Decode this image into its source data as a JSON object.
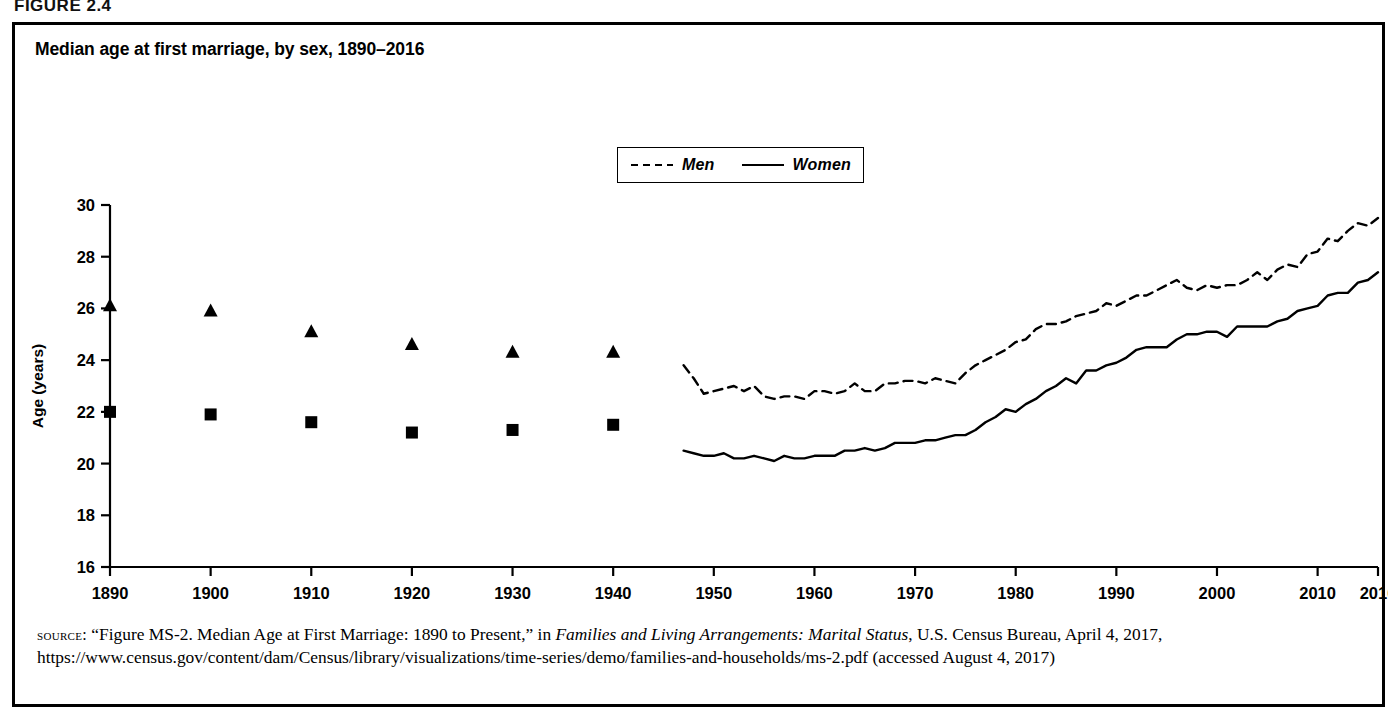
{
  "figure": {
    "label": "FIGURE 2.4",
    "title": "Median age at first marriage, by sex, 1890–2016"
  },
  "legend": {
    "position": "top-center",
    "entries": [
      {
        "label": "Men",
        "style": "dashed",
        "marker": "triangle"
      },
      {
        "label": "Women",
        "style": "solid",
        "marker": "square"
      }
    ]
  },
  "source": {
    "prefix": "source:",
    "part1": " “Figure MS-2. Median Age at First Marriage: 1890 to Present,” in ",
    "italic_title": "Families and Living Arrangements: Marital Status",
    "part2": ", U.S. Census Bureau, April 4, 2017, https://www.census.gov/content/dam/Census/library/visualizations/time-series/demo/families-and-households/ms-2.pdf (accessed August 4, 2017)"
  },
  "chart_data": {
    "type": "line",
    "title": "Median age at first marriage, by sex, 1890–2016",
    "xlabel": "",
    "ylabel": "Age (years)",
    "xlim": [
      1890,
      2016
    ],
    "ylim": [
      16,
      30
    ],
    "ytick_step": 2,
    "yticks": [
      16,
      18,
      20,
      22,
      24,
      26,
      28,
      30
    ],
    "xticks": [
      1890,
      1900,
      1910,
      1920,
      1930,
      1940,
      1950,
      1960,
      1970,
      1980,
      1990,
      2000,
      2010,
      2016
    ],
    "xtick_labels": [
      "1890",
      "1900",
      "1910",
      "1920",
      "1930",
      "1940",
      "1950",
      "1960",
      "1970",
      "1980",
      "1990",
      "2000",
      "2010",
      "2016"
    ],
    "grid": false,
    "legend_position": "top-center",
    "line_color": "#000000",
    "series": [
      {
        "name": "Men",
        "style": "dashed",
        "marker": "triangle",
        "marker_points": {
          "x": [
            1890,
            1900,
            1910,
            1920,
            1930,
            1940
          ],
          "y": [
            26.1,
            25.9,
            25.1,
            24.6,
            24.3,
            24.3
          ]
        },
        "x": [
          1947,
          1948,
          1949,
          1950,
          1951,
          1952,
          1953,
          1954,
          1955,
          1956,
          1957,
          1958,
          1959,
          1960,
          1961,
          1962,
          1963,
          1964,
          1965,
          1966,
          1967,
          1968,
          1969,
          1970,
          1971,
          1972,
          1973,
          1974,
          1975,
          1976,
          1977,
          1978,
          1979,
          1980,
          1981,
          1982,
          1983,
          1984,
          1985,
          1986,
          1987,
          1988,
          1989,
          1990,
          1991,
          1992,
          1993,
          1994,
          1995,
          1996,
          1997,
          1998,
          1999,
          2000,
          2001,
          2002,
          2003,
          2004,
          2005,
          2006,
          2007,
          2008,
          2009,
          2010,
          2011,
          2012,
          2013,
          2014,
          2015,
          2016
        ],
        "y": [
          23.8,
          23.3,
          22.7,
          22.8,
          22.9,
          23.0,
          22.8,
          23.0,
          22.6,
          22.5,
          22.6,
          22.6,
          22.5,
          22.8,
          22.8,
          22.7,
          22.8,
          23.1,
          22.8,
          22.8,
          23.1,
          23.1,
          23.2,
          23.2,
          23.1,
          23.3,
          23.2,
          23.1,
          23.5,
          23.8,
          24.0,
          24.2,
          24.4,
          24.7,
          24.8,
          25.2,
          25.4,
          25.4,
          25.5,
          25.7,
          25.8,
          25.9,
          26.2,
          26.1,
          26.3,
          26.5,
          26.5,
          26.7,
          26.9,
          27.1,
          26.8,
          26.7,
          26.9,
          26.8,
          26.9,
          26.9,
          27.1,
          27.4,
          27.1,
          27.5,
          27.7,
          27.6,
          28.1,
          28.2,
          28.7,
          28.6,
          29.0,
          29.3,
          29.2,
          29.5
        ]
      },
      {
        "name": "Women",
        "style": "solid",
        "marker": "square",
        "marker_points": {
          "x": [
            1890,
            1900,
            1910,
            1920,
            1930,
            1940
          ],
          "y": [
            22.0,
            21.9,
            21.6,
            21.2,
            21.3,
            21.5
          ]
        },
        "x": [
          1947,
          1948,
          1949,
          1950,
          1951,
          1952,
          1953,
          1954,
          1955,
          1956,
          1957,
          1958,
          1959,
          1960,
          1961,
          1962,
          1963,
          1964,
          1965,
          1966,
          1967,
          1968,
          1969,
          1970,
          1971,
          1972,
          1973,
          1974,
          1975,
          1976,
          1977,
          1978,
          1979,
          1980,
          1981,
          1982,
          1983,
          1984,
          1985,
          1986,
          1987,
          1988,
          1989,
          1990,
          1991,
          1992,
          1993,
          1994,
          1995,
          1996,
          1997,
          1998,
          1999,
          2000,
          2001,
          2002,
          2003,
          2004,
          2005,
          2006,
          2007,
          2008,
          2009,
          2010,
          2011,
          2012,
          2013,
          2014,
          2015,
          2016
        ],
        "y": [
          20.5,
          20.4,
          20.3,
          20.3,
          20.4,
          20.2,
          20.2,
          20.3,
          20.2,
          20.1,
          20.3,
          20.2,
          20.2,
          20.3,
          20.3,
          20.3,
          20.5,
          20.5,
          20.6,
          20.5,
          20.6,
          20.8,
          20.8,
          20.8,
          20.9,
          20.9,
          21.0,
          21.1,
          21.1,
          21.3,
          21.6,
          21.8,
          22.1,
          22.0,
          22.3,
          22.5,
          22.8,
          23.0,
          23.3,
          23.1,
          23.6,
          23.6,
          23.8,
          23.9,
          24.1,
          24.4,
          24.5,
          24.5,
          24.5,
          24.8,
          25.0,
          25.0,
          25.1,
          25.1,
          24.9,
          25.3,
          25.3,
          25.3,
          25.3,
          25.5,
          25.6,
          25.9,
          26.0,
          26.1,
          26.5,
          26.6,
          26.6,
          27.0,
          27.1,
          27.4
        ]
      }
    ]
  }
}
